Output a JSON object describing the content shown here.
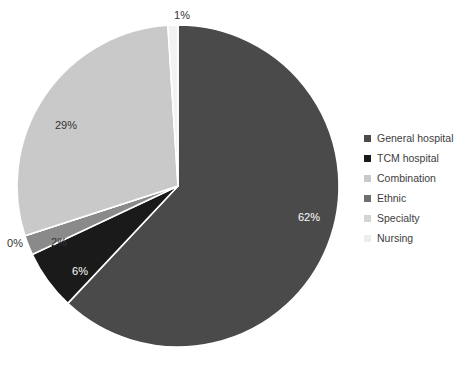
{
  "chart_data": {
    "type": "pie",
    "title": "",
    "legend_position": "right",
    "labels": [
      "General hospital",
      "TCM hospital",
      "Combination",
      "Ethnic",
      "Specialty",
      "Nursing"
    ],
    "values": [
      62,
      6,
      2,
      0,
      29,
      1
    ],
    "value_labels": [
      "62%",
      "6%",
      "2%",
      "0%",
      "29%",
      "1%"
    ],
    "colors": [
      "#4a4a4a",
      "#1a1a1a",
      "#8a8a8a",
      "#6e6e6e",
      "#c9c9c9",
      "#f2f2f2"
    ],
    "label_text_colors": [
      "#ffffff",
      "#ffffff",
      "#333333",
      "#333333",
      "#333333",
      "#333333"
    ],
    "start_angle_deg": 0,
    "direction": "clockwise",
    "slice_separator_color": "#ffffff",
    "background": "#ffffff"
  },
  "pie": {
    "center_x": 178,
    "center_y": 186,
    "radius": 161,
    "slices": [
      {
        "name": "General hospital",
        "value": 62,
        "label": "62%",
        "color": "#4a4a4a",
        "label_color": "#ffffff",
        "label_x": 309,
        "label_y": 218
      },
      {
        "name": "TCM hospital",
        "value": 6,
        "label": "6%",
        "color": "#1a1a1a",
        "label_color": "#ffffff",
        "label_x": 80,
        "label_y": 272
      },
      {
        "name": "Combination",
        "value": 2,
        "label": "2%",
        "color": "#8a8a8a",
        "label_color": "#333333",
        "label_x": 59,
        "label_y": 243
      },
      {
        "name": "Ethnic",
        "value": 0,
        "label": "0%",
        "color": "#6e6e6e",
        "label_color": "#333333",
        "label_x": 15,
        "label_y": 244
      },
      {
        "name": "Specialty",
        "value": 29,
        "label": "29%",
        "color": "#c9c9c9",
        "label_color": "#333333",
        "label_x": 66,
        "label_y": 126
      },
      {
        "name": "Nursing",
        "value": 1,
        "label": "1%",
        "color": "#f2f2f2",
        "label_color": "#333333",
        "label_x": 182,
        "label_y": 16
      }
    ]
  },
  "legend": {
    "items": [
      {
        "label": "General hospital",
        "color": "#4a4a4a"
      },
      {
        "label": "TCM hospital",
        "color": "#1a1a1a"
      },
      {
        "label": "Combination",
        "color": "#c9c9c9"
      },
      {
        "label": "Ethnic",
        "color": "#6e6e6e"
      },
      {
        "label": "Specialty",
        "color": "#d4d4d4"
      },
      {
        "label": "Nursing",
        "color": "#ededed"
      }
    ]
  },
  "caption": {
    "text": ""
  }
}
